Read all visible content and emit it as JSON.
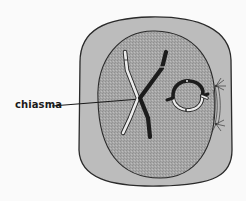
{
  "diagram": {
    "labels": [
      {
        "id": "chiasma",
        "text": "chiasma"
      }
    ],
    "colors": {
      "background": "#fafafa",
      "cytoplasm": "#b9b9b9",
      "nucleus": "#a3a3a3",
      "outline": "#2a2a2a",
      "dark_chromatid": "#1c1c1c",
      "light_chromatid": "#e6e6e6"
    }
  }
}
